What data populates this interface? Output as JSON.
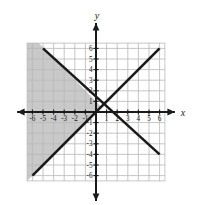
{
  "chart_data": {
    "type": "line",
    "title": "",
    "xlabel": "x",
    "ylabel": "y",
    "xlim": [
      -7,
      7
    ],
    "ylim": [
      -7,
      7
    ],
    "grid": true,
    "grid_extent": {
      "xmin": -6.5,
      "xmax": 6.5,
      "ymin": -6.5,
      "ymax": 6.5
    },
    "legend": "none",
    "xticks": [
      -6,
      -5,
      -4,
      -3,
      -2,
      -1,
      1,
      2,
      3,
      4,
      5,
      6
    ],
    "yticks": [
      6,
      5,
      4,
      3,
      2,
      1,
      -1,
      -2,
      -3,
      -4,
      -5,
      -6
    ],
    "xtick_labels": [
      "-6",
      "-5",
      "-4",
      "-3",
      "-2",
      "-1",
      "1",
      "2",
      "3",
      "4",
      "5",
      "6"
    ],
    "ytick_labels": [
      "6",
      "5",
      "4",
      "3",
      "2",
      "1",
      "-1",
      "-2",
      "-3",
      "-4",
      "-5",
      "-6"
    ],
    "series": [
      {
        "name": "descending-line",
        "type": "line",
        "slope": -1,
        "intercept": 1,
        "points": [
          [
            -5,
            6
          ],
          [
            6,
            -4
          ]
        ],
        "style": "solid",
        "color": "#1a1a1a"
      },
      {
        "name": "ascending-line",
        "type": "line",
        "slope": 1,
        "intercept": 0,
        "points": [
          [
            -6,
            -6
          ],
          [
            6,
            6
          ]
        ],
        "style": "solid",
        "color": "#1a1a1a"
      }
    ],
    "shaded_regions": [
      {
        "name": "solution-region",
        "description": "Region left of the ascending line and above-left of the descending line",
        "color": "#c9c9c9",
        "vertices": [
          [
            -6.5,
            6.5
          ],
          [
            -5.4,
            6.5
          ],
          [
            0.5,
            0.5
          ],
          [
            -6.5,
            -6.5
          ]
        ]
      }
    ],
    "axis_arrows": [
      "left",
      "right",
      "up",
      "down"
    ]
  },
  "labels": {
    "x_axis": "x",
    "y_axis": "y"
  },
  "colors": {
    "background": "#ffffff",
    "grid_line": "#b8b8b8",
    "grid_line_shaded": "#a8a8a8",
    "axis": "#1a1a1a",
    "line": "#1a1a1a",
    "shade": "#c9c9c9",
    "tick_text": "#1a1a1a"
  }
}
